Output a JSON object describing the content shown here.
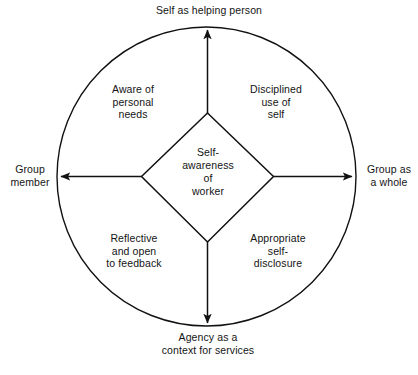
{
  "diagram": {
    "type": "circle-quadrant-diagram",
    "colors": {
      "stroke": "#111111",
      "background": "#ffffff",
      "text": "#141414"
    },
    "center": {
      "name": "self-awareness-of-worker",
      "text": "Self-\nawareness\nof\nworker"
    },
    "axis_labels": {
      "top": "Self as helping person",
      "left": "Group\nmember",
      "right": "Group as\na whole",
      "bottom": "Agency as a\ncontext for services"
    },
    "quadrants": {
      "upper_left": "Aware of\npersonal\nneeds",
      "upper_right": "Disciplined\nuse of\nself",
      "lower_left": "Reflective\nand open\nto feedback",
      "lower_right": "Appropriate\nself-\ndisclosure"
    },
    "arrows": [
      {
        "name": "arrow-up",
        "direction": "up",
        "from": "diamond-top-vertex",
        "to": "circle-top"
      },
      {
        "name": "arrow-left",
        "direction": "left",
        "from": "diamond-left-vertex",
        "to": "circle-left"
      },
      {
        "name": "arrow-right",
        "direction": "right",
        "from": "diamond-right-vertex",
        "to": "circle-right"
      },
      {
        "name": "arrow-down",
        "direction": "down",
        "from": "diamond-bottom-vertex",
        "to": "circle-bottom"
      }
    ]
  }
}
